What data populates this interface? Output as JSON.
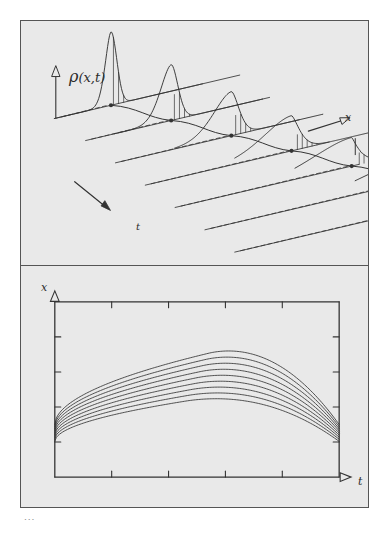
{
  "figure": {
    "background_color": "#e9e9e9",
    "ink_color": "#333333",
    "frame_color": "#555555",
    "caption_remnant": "..."
  },
  "top_panel": {
    "name": "density-waterfall-panel",
    "vertical_axis_label": "ρ",
    "vertical_axis_args": "(x,t)",
    "x_axis_label": "x",
    "t_axis_label": "t",
    "x_arrow": {
      "name": "x-direction-arrow",
      "direction": "up-right"
    },
    "t_arrow": {
      "name": "t-direction-arrow",
      "direction": "down-right"
    },
    "description": "Waterfall of successive density profiles ρ(x,t) steepening into a shock front",
    "profile_count": 7
  },
  "bottom_panel": {
    "name": "characteristics-panel",
    "y_axis_label": "x",
    "x_axis_label": "t",
    "y_ticks": 4,
    "x_ticks": 4,
    "curve_count": 9,
    "description": "Family of characteristic curves x(t) rising, cresting and converging"
  },
  "chart_data": {
    "type": "line",
    "panels": [
      {
        "id": "top",
        "type": "line",
        "title": "ρ(x,t) waterfall",
        "xlabel": "x",
        "ylabel": "ρ(x,t)",
        "tlabel": "t",
        "grid": false,
        "legend": "none",
        "note": "Seven successive snapshots in time; each profile drawn on its own offset baseline. Initial profile is a narrow symmetric Gaussian; later profiles broaden, skew forward and develop a vertical shock edge with hatched shading on the trailing side. Filled dots mark each profile's foot; dashed segments link baseline origin to the dot; a solid trajectory threads through all dots.",
        "series": [
          {
            "name": "t1",
            "peak_height": 1.0,
            "peak_width": 0.055,
            "skew": 0.0,
            "shock": 0.0
          },
          {
            "name": "t2",
            "peak_height": 0.76,
            "peak_width": 0.07,
            "skew": 0.18,
            "shock": 0.1
          },
          {
            "name": "t3",
            "peak_height": 0.6,
            "peak_width": 0.09,
            "skew": 0.36,
            "shock": 0.24
          },
          {
            "name": "t4",
            "peak_height": 0.48,
            "peak_width": 0.115,
            "skew": 0.54,
            "shock": 0.42
          },
          {
            "name": "t5",
            "peak_height": 0.39,
            "peak_width": 0.14,
            "skew": 0.7,
            "shock": 0.62
          },
          {
            "name": "t6",
            "peak_height": 0.33,
            "peak_width": 0.165,
            "skew": 0.85,
            "shock": 0.82
          },
          {
            "name": "t7",
            "peak_height": 0.29,
            "peak_width": 0.19,
            "skew": 1.0,
            "shock": 1.0
          }
        ]
      },
      {
        "id": "bottom",
        "type": "line",
        "title": "Characteristic curves",
        "xlabel": "t",
        "ylabel": "x",
        "xlim": [
          0,
          1
        ],
        "ylim": [
          0,
          1
        ],
        "grid": false,
        "legend": "none",
        "note": "Nine characteristics emanating from a common neighbourhood at the left axis, rising to a crest near the middle-right and falling away; they fan out slightly and crowd together near the origin.",
        "series": [
          {
            "name": "c1",
            "start_x": 0.3,
            "amplitude": 0.56,
            "crest_t": 0.54
          },
          {
            "name": "c2",
            "start_x": 0.288,
            "amplitude": 0.533,
            "crest_t": 0.53
          },
          {
            "name": "c3",
            "start_x": 0.276,
            "amplitude": 0.506,
            "crest_t": 0.52
          },
          {
            "name": "c4",
            "start_x": 0.264,
            "amplitude": 0.479,
            "crest_t": 0.51
          },
          {
            "name": "c5",
            "start_x": 0.252,
            "amplitude": 0.452,
            "crest_t": 0.5
          },
          {
            "name": "c6",
            "start_x": 0.24,
            "amplitude": 0.425,
            "crest_t": 0.49
          },
          {
            "name": "c7",
            "start_x": 0.228,
            "amplitude": 0.398,
            "crest_t": 0.48
          },
          {
            "name": "c8",
            "start_x": 0.216,
            "amplitude": 0.371,
            "crest_t": 0.47
          },
          {
            "name": "c9",
            "start_x": 0.204,
            "amplitude": 0.344,
            "crest_t": 0.46
          }
        ]
      }
    ]
  }
}
